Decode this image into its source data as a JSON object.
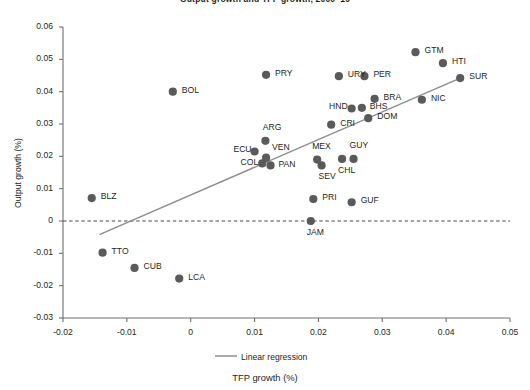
{
  "chart_data": {
    "type": "scatter",
    "title": "Output growth and TFP growth, 2000–10",
    "xlabel": "TFP growth (%)",
    "ylabel": "Output growth (%)",
    "xlim": [
      -0.02,
      0.05
    ],
    "ylim": [
      -0.03,
      0.06
    ],
    "xticks": [
      "-0.02",
      "-0.01",
      "0",
      "0.01",
      "0.02",
      "0.03",
      "0.04",
      "0.05"
    ],
    "xtick_values": [
      -0.02,
      -0.01,
      0,
      0.01,
      0.02,
      0.03,
      0.04,
      0.05
    ],
    "yticks": [
      "0.06",
      "0.05",
      "0.04",
      "0.03",
      "0.02",
      "0.01",
      "0",
      "-0.01",
      "-0.02",
      "-0.03"
    ],
    "ytick_values": [
      0.06,
      0.05,
      0.04,
      0.03,
      0.02,
      0.01,
      0,
      -0.01,
      -0.02,
      -0.03
    ],
    "grid": false,
    "legend_position": "bottom-center",
    "series": [
      {
        "name": "Countries",
        "marker_color": "#5a5a5a",
        "points": [
          {
            "label": "BLZ",
            "x": -0.0155,
            "y": 0.0071,
            "label_dx": 9,
            "label_dy": -4
          },
          {
            "label": "TTO",
            "x": -0.0138,
            "y": -0.0098,
            "label_dx": 9,
            "label_dy": -4
          },
          {
            "label": "CUB",
            "x": -0.0088,
            "y": -0.0145,
            "label_dx": 9,
            "label_dy": -4
          },
          {
            "label": "LCA",
            "x": -0.0018,
            "y": -0.0178,
            "label_dx": 9,
            "label_dy": -4
          },
          {
            "label": "BOL",
            "x": -0.0028,
            "y": 0.04,
            "label_dx": 9,
            "label_dy": -4
          },
          {
            "label": "PRY",
            "x": 0.0118,
            "y": 0.0452,
            "label_dx": 9,
            "label_dy": -4
          },
          {
            "label": "ARG",
            "x": 0.0117,
            "y": 0.0248,
            "label_dx": -8,
            "label_dy": -16
          },
          {
            "label": "ECU",
            "x": 0.01,
            "y": 0.0215,
            "label_dx": -27,
            "label_dy": -4
          },
          {
            "label": "VEN",
            "x": 0.0118,
            "y": 0.0196,
            "label_dx": 6,
            "label_dy": -13
          },
          {
            "label": "COL",
            "x": 0.0112,
            "y": 0.0178,
            "label_dx": -28,
            "label_dy": -3
          },
          {
            "label": "PAN",
            "x": 0.0125,
            "y": 0.0172,
            "label_dx": 8,
            "label_dy": -3
          },
          {
            "label": "MEX",
            "x": 0.0198,
            "y": 0.019,
            "label_dx": -5,
            "label_dy": -16
          },
          {
            "label": "SEV",
            "x": 0.0205,
            "y": 0.0172,
            "label_dx": -3,
            "label_dy": 9
          },
          {
            "label": "CHL",
            "x": 0.0237,
            "y": 0.0192,
            "label_dx": -4,
            "label_dy": 9
          },
          {
            "label": "GUY",
            "x": 0.0255,
            "y": 0.0192,
            "label_dx": -4,
            "label_dy": -16
          },
          {
            "label": "CRI",
            "x": 0.022,
            "y": 0.0298,
            "label_dx": 9,
            "label_dy": -4
          },
          {
            "label": "HND",
            "x": 0.0252,
            "y": 0.0348,
            "label_dx": -28,
            "label_dy": -4
          },
          {
            "label": "BHS",
            "x": 0.0268,
            "y": 0.035,
            "label_dx": 8,
            "label_dy": -4
          },
          {
            "label": "DOM",
            "x": 0.0278,
            "y": 0.0318,
            "label_dx": 9,
            "label_dy": -4
          },
          {
            "label": "BRA",
            "x": 0.0288,
            "y": 0.0378,
            "label_dx": 9,
            "label_dy": -4
          },
          {
            "label": "URY",
            "x": 0.0232,
            "y": 0.0448,
            "label_dx": 9,
            "label_dy": -4
          },
          {
            "label": "PER",
            "x": 0.0272,
            "y": 0.0448,
            "label_dx": 9,
            "label_dy": -4
          },
          {
            "label": "GTM",
            "x": 0.0352,
            "y": 0.0522,
            "label_dx": 9,
            "label_dy": -4
          },
          {
            "label": "HTI",
            "x": 0.0395,
            "y": 0.0488,
            "label_dx": 9,
            "label_dy": -4
          },
          {
            "label": "SUR",
            "x": 0.0422,
            "y": 0.0442,
            "label_dx": 9,
            "label_dy": -4
          },
          {
            "label": "NIC",
            "x": 0.0362,
            "y": 0.0375,
            "label_dx": 9,
            "label_dy": -4
          },
          {
            "label": "PRI",
            "x": 0.0192,
            "y": 0.0068,
            "label_dx": 9,
            "label_dy": -4
          },
          {
            "label": "GUF",
            "x": 0.0252,
            "y": 0.0058,
            "label_dx": 9,
            "label_dy": -4
          },
          {
            "label": "JAM",
            "x": 0.0188,
            "y": 0.0,
            "label_dx": -4,
            "label_dy": 9
          }
        ]
      }
    ],
    "regression": {
      "name": "Linear regression",
      "color": "#8e8e8e",
      "x_start": -0.0143,
      "y_start": -0.0042,
      "x_end": 0.0422,
      "y_end": 0.0442
    },
    "zero_line": {
      "name": "zero-reference",
      "y": 0,
      "style": "dashed",
      "color": "#4a4a4a"
    }
  },
  "legend": {
    "entries": [
      {
        "label": "Linear regression",
        "type": "line",
        "color": "#8e8e8e"
      }
    ]
  }
}
